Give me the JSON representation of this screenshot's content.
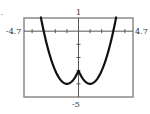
{
  "marker": ".",
  "chart_data": {
    "type": "line",
    "title": "",
    "xlabel": "",
    "ylabel": "",
    "xlim": [
      -4.7,
      4.7
    ],
    "ylim": [
      -5,
      1
    ],
    "tick_labels": {
      "xmin": "-4.7",
      "xmax": "4.7",
      "ymax": "1",
      "ymin": "-5"
    },
    "x_ticks": [
      -4,
      -3,
      -2,
      -1,
      1,
      2,
      3,
      4
    ],
    "y_ticks": [
      -4,
      -3,
      -2,
      -1
    ],
    "grid": false,
    "legend": null,
    "series": [
      {
        "name": "f(x)",
        "description": "W-shaped curve symmetric about y-axis: local max (0,-3), minima near (-1,-4) and (1,-4), x-intercepts near -3 and 3",
        "x": [
          -3.3,
          -3.0,
          -2.5,
          -2.0,
          -1.5,
          -1.0,
          -0.5,
          0.0,
          0.5,
          1.0,
          1.5,
          2.0,
          2.5,
          3.0,
          3.3
        ],
        "y": [
          1.29,
          0.0,
          -1.75,
          -3.0,
          -3.75,
          -4.0,
          -3.75,
          -3.0,
          -3.75,
          -4.0,
          -3.75,
          -3.0,
          -1.75,
          0.0,
          1.29
        ]
      }
    ]
  }
}
